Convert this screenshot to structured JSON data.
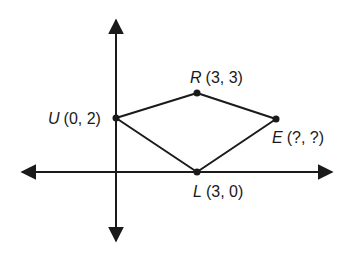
{
  "diagram": {
    "type": "coordinate-plane-quadrilateral",
    "points": {
      "U": {
        "name": "U",
        "coords": "(0, 2)"
      },
      "R": {
        "name": "R",
        "coords": "(3, 3)"
      },
      "E": {
        "name": "E",
        "coords": "(?, ?)"
      },
      "L": {
        "name": "L",
        "coords": "(3, 0)"
      }
    },
    "edges": [
      "U-R",
      "R-E",
      "E-L",
      "L-U"
    ],
    "colors": {
      "line": "#1a1a1a",
      "background": "#ffffff"
    }
  }
}
